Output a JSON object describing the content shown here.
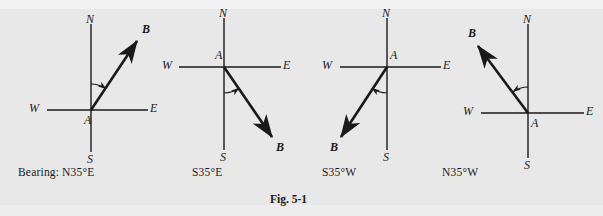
{
  "figure": {
    "caption": "Fig. 5-1",
    "bearing_row_label": "Bearing:",
    "background_color": "#e8e8e8",
    "ink_color": "#1a1a1a"
  },
  "diagrams": [
    {
      "name": "n35e",
      "bearing_label": "N35°E",
      "origin_label": "A",
      "endpoint_label": "B",
      "compass": {
        "north": "N",
        "south": "S",
        "east": "E",
        "west": "W"
      },
      "origin": {
        "x": 91,
        "y": 110
      },
      "axis": {
        "x1": 47,
        "x2": 148,
        "y1": 24,
        "y2": 152
      },
      "ray": {
        "tip_x": 137,
        "tip_y": 41
      },
      "angle_deg": 35,
      "angle_from": "north",
      "angle_toward": "east",
      "origin_label_pos": {
        "x": 84,
        "y": 113
      },
      "endpoint_label_pos": {
        "x": 142,
        "y": 22
      },
      "label_pos": {
        "north": {
          "x": 86,
          "y": 12
        },
        "south": {
          "x": 87,
          "y": 152
        },
        "east": {
          "x": 150,
          "y": 101
        },
        "west": {
          "x": 29,
          "y": 101
        }
      }
    },
    {
      "name": "s35e",
      "bearing_label": "S35°E",
      "origin_label": "A",
      "endpoint_label": "B",
      "compass": {
        "north": "N",
        "south": "S",
        "east": "E",
        "west": "W"
      },
      "origin": {
        "x": 224,
        "y": 67
      },
      "axis": {
        "x1": 179,
        "x2": 281,
        "y1": 18,
        "y2": 150
      },
      "ray": {
        "tip_x": 272,
        "tip_y": 137
      },
      "angle_deg": 35,
      "angle_from": "south",
      "angle_toward": "east",
      "origin_label_pos": {
        "x": 215,
        "y": 48
      },
      "endpoint_label_pos": {
        "x": 276,
        "y": 140
      },
      "label_pos": {
        "north": {
          "x": 219,
          "y": 6
        },
        "south": {
          "x": 220,
          "y": 150
        },
        "east": {
          "x": 283,
          "y": 58
        },
        "west": {
          "x": 162,
          "y": 58
        }
      }
    },
    {
      "name": "s35w",
      "bearing_label": "S35°W",
      "origin_label": "A",
      "endpoint_label": "B",
      "compass": {
        "north": "N",
        "south": "S",
        "east": "E",
        "west": "W"
      },
      "origin": {
        "x": 387,
        "y": 67
      },
      "axis": {
        "x1": 340,
        "x2": 441,
        "y1": 18,
        "y2": 150
      },
      "ray": {
        "tip_x": 341,
        "tip_y": 137
      },
      "angle_deg": 35,
      "angle_from": "south",
      "angle_toward": "west",
      "origin_label_pos": {
        "x": 390,
        "y": 48
      },
      "endpoint_label_pos": {
        "x": 330,
        "y": 140
      },
      "label_pos": {
        "north": {
          "x": 382,
          "y": 6
        },
        "south": {
          "x": 383,
          "y": 150
        },
        "east": {
          "x": 443,
          "y": 58
        },
        "west": {
          "x": 322,
          "y": 58
        }
      }
    },
    {
      "name": "n35w",
      "bearing_label": "N35°W",
      "origin_label": "A",
      "endpoint_label": "B",
      "compass": {
        "north": "N",
        "south": "S",
        "east": "E",
        "west": "W"
      },
      "origin": {
        "x": 528,
        "y": 113
      },
      "axis": {
        "x1": 481,
        "x2": 584,
        "y1": 24,
        "y2": 158
      },
      "ray": {
        "tip_x": 478,
        "tip_y": 46
      },
      "angle_deg": 35,
      "angle_from": "north",
      "angle_toward": "west",
      "origin_label_pos": {
        "x": 531,
        "y": 116
      },
      "endpoint_label_pos": {
        "x": 468,
        "y": 26
      },
      "label_pos": {
        "north": {
          "x": 523,
          "y": 12
        },
        "south": {
          "x": 524,
          "y": 158
        },
        "east": {
          "x": 586,
          "y": 104
        },
        "west": {
          "x": 463,
          "y": 104
        }
      }
    }
  ],
  "bearing_row": {
    "label": "Bearing:",
    "label_pos": {
      "x": 18,
      "y": 166
    },
    "items": [
      {
        "text": "N35°E",
        "x": 62,
        "y": 166
      },
      {
        "text": "S35°E",
        "x": 192,
        "y": 166
      },
      {
        "text": "S35°W",
        "x": 322,
        "y": 166
      },
      {
        "text": "N35°W",
        "x": 442,
        "y": 166
      }
    ]
  },
  "caption": {
    "text": "Fig. 5-1",
    "x": 270,
    "y": 193
  }
}
